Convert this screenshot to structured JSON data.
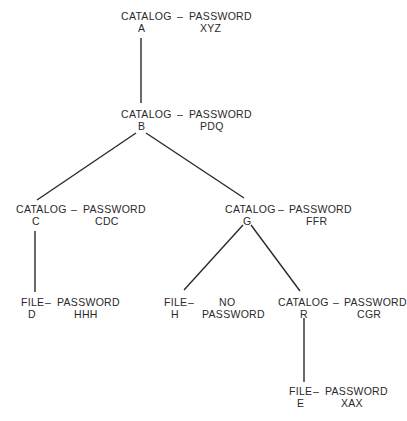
{
  "diagram": {
    "type": "tree",
    "nodes": [
      {
        "id": "A",
        "kind": "CATALOG",
        "separator": "–",
        "password_label": "PASSWORD",
        "password": "XYZ"
      },
      {
        "id": "B",
        "kind": "CATALOG",
        "separator": "–",
        "password_label": "PASSWORD",
        "password": "PDQ"
      },
      {
        "id": "C",
        "kind": "CATALOG",
        "separator": "–",
        "password_label": "PASSWORD",
        "password": "CDC"
      },
      {
        "id": "G",
        "kind": "CATALOG",
        "separator": "–",
        "password_label": "PASSWORD",
        "password": "FFR"
      },
      {
        "id": "D",
        "kind": "FILE",
        "separator": "–",
        "password_label": "PASSWORD",
        "password": "HHH"
      },
      {
        "id": "H",
        "kind": "FILE",
        "separator": "–",
        "password_label": "NO",
        "password": "PASSWORD"
      },
      {
        "id": "R",
        "kind": "CATALOG",
        "separator": "–",
        "password_label": "PASSWORD",
        "password": "CGR"
      },
      {
        "id": "E",
        "kind": "FILE",
        "separator": "–",
        "password_label": "PASSWORD",
        "password": "XAX"
      }
    ],
    "edges": [
      {
        "from": "A",
        "to": "B"
      },
      {
        "from": "B",
        "to": "C"
      },
      {
        "from": "B",
        "to": "G"
      },
      {
        "from": "C",
        "to": "D"
      },
      {
        "from": "G",
        "to": "H"
      },
      {
        "from": "G",
        "to": "R"
      },
      {
        "from": "R",
        "to": "E"
      }
    ]
  }
}
